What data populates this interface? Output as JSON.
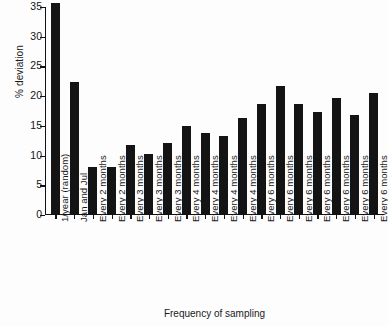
{
  "chart_data": {
    "type": "bar",
    "title": "",
    "xlabel": "Frequency of sampling",
    "ylabel": "% deviation",
    "ylim": [
      0,
      35
    ],
    "yticks": [
      0,
      5,
      10,
      15,
      20,
      25,
      30,
      35
    ],
    "grid": false,
    "legend": null,
    "bar_color": "#141414",
    "categories": [
      "1/year (random)",
      "Jan and Jul",
      "Every 2 months",
      "Every 2 months",
      "Every 3 months",
      "Every 3 months",
      "Every 3 months",
      "Every 4 months",
      "Every 4 months",
      "Every 4 months",
      "Every 4 months",
      "Every 6 months",
      "Every 6 months",
      "Every 6 months",
      "Every 6 months",
      "Every 6 months",
      "Every 6 months",
      "Every 6 months"
    ],
    "values": [
      35.5,
      22.2,
      7.9,
      7.9,
      11.6,
      10.0,
      11.9,
      14.7,
      13.6,
      13.1,
      16.1,
      18.4,
      21.5,
      18.5,
      17.1,
      19.4,
      16.6,
      20.3
    ]
  }
}
